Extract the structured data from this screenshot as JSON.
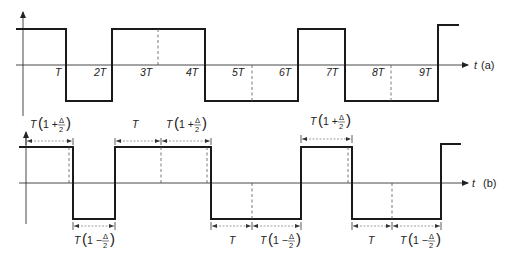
{
  "panels": [
    {
      "id": "a",
      "label": "(a)",
      "axis_var": "t",
      "tick_labels": [
        "T",
        "2T",
        "3T",
        "4T",
        "5T",
        "6T",
        "7T",
        "8T",
        "9T"
      ],
      "waveform": {
        "type": "square",
        "levels": [
          "high",
          "low",
          "high",
          "low",
          "high",
          "low",
          "high"
        ],
        "transitions_in_T": [
          1,
          2,
          4,
          6,
          7,
          9
        ],
        "dashed_markers_in_T": [
          3,
          5,
          8
        ]
      }
    },
    {
      "id": "b",
      "label": "(b)",
      "axis_var": "t",
      "waveform": {
        "type": "square",
        "levels": [
          "high",
          "low",
          "high",
          "low",
          "high",
          "low",
          "high"
        ],
        "description": "square wave with alternating durations T(1+Δ/2), T(1−Δ/2), T"
      },
      "top_dimensions": [
        {
          "text": "T",
          "paren": "1 + ",
          "frac_num": "Δ",
          "frac_den": "2"
        },
        {
          "text": "T"
        },
        {
          "text": "T",
          "paren": "1 + ",
          "frac_num": "Δ",
          "frac_den": "2"
        },
        {
          "text": "T",
          "paren": "1 + ",
          "frac_num": "Δ",
          "frac_den": "2"
        }
      ],
      "bottom_dimensions": [
        {
          "text": "T",
          "paren": "1 − ",
          "frac_num": "Δ",
          "frac_den": "2"
        },
        {
          "text": "T"
        },
        {
          "text": "T",
          "paren": "1 − ",
          "frac_num": "Δ",
          "frac_den": "2"
        },
        {
          "text": "T"
        },
        {
          "text": "T",
          "paren": "1 − ",
          "frac_num": "Δ",
          "frac_den": "2"
        }
      ]
    }
  ]
}
